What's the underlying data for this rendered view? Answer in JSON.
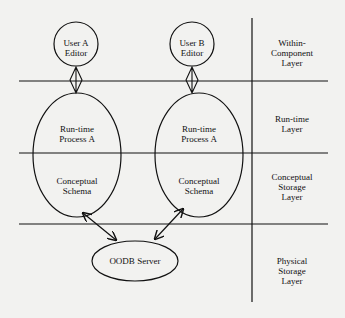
{
  "nodes": {
    "user_a_editor": "User A\nEditor",
    "user_b_editor": "User B\nEditor",
    "runtime_process_a_left": "Run-time\nProcess A",
    "runtime_process_a_right": "Run-time\nProcess A",
    "conceptual_schema_left": "Conceptual\nSchema",
    "conceptual_schema_right": "Conceptual\nSchema",
    "oodb_server": "OODB Server"
  },
  "layers": [
    {
      "label": "Within-\nComponent\nLayer"
    },
    {
      "label": "Run-time\nLayer"
    },
    {
      "label": "Conceptual\nStorage\nLayer"
    },
    {
      "label": "Physical\nStorage\nLayer"
    }
  ],
  "colors": {
    "line": "#111111",
    "background": "#f2f2f0"
  }
}
